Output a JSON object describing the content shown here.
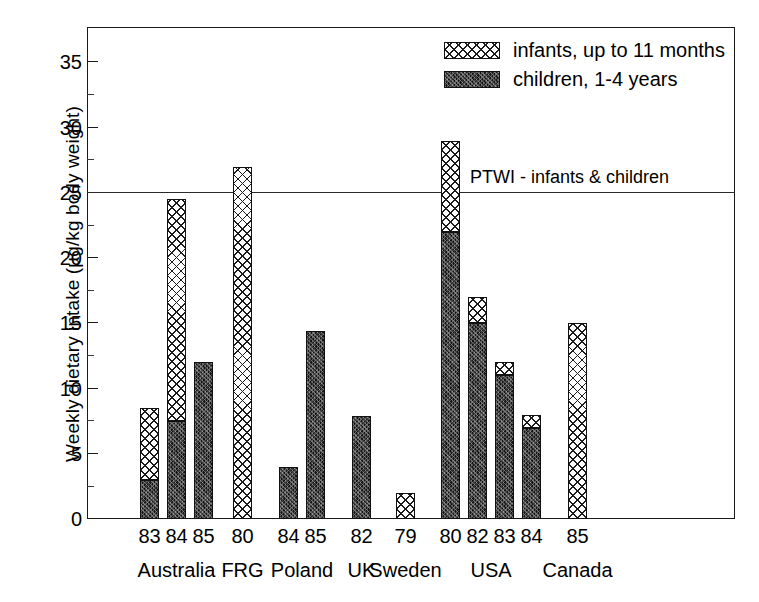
{
  "chart_data": {
    "type": "bar",
    "title": "",
    "subtitle": "",
    "xlabel": "",
    "ylabel": "Weekly dietary intake (µg/kg body weight)",
    "ylim": [
      0,
      37.5
    ],
    "yticks": [
      0,
      5,
      10,
      15,
      20,
      25,
      30,
      35
    ],
    "ytick_labels": [
      "0",
      "5",
      "10",
      "15",
      "20",
      "25",
      "30",
      "35"
    ],
    "yminor_ticks": [
      2.5,
      7.5,
      12.5,
      17.5,
      22.5,
      27.5,
      32.5
    ],
    "grid": false,
    "stacked": true,
    "legend_position": "top-right",
    "legend": [
      {
        "name": "infants, up to 11 months",
        "pattern": "cross-hatch"
      },
      {
        "name": "children, 1-4 years",
        "pattern": "dark-stipple"
      }
    ],
    "series": [
      {
        "name": "children, 1-4 years",
        "values": [
          3.0,
          7.5,
          12.0,
          0.0,
          4.0,
          14.4,
          7.9,
          0.0,
          22.0,
          15.0,
          11.0,
          7.0,
          0.0
        ]
      },
      {
        "name": "infants, up to 11 months",
        "values": [
          5.5,
          17.0,
          0.0,
          27.0,
          0.0,
          0.0,
          0.0,
          2.0,
          7.0,
          2.0,
          1.0,
          1.0,
          15.0
        ]
      }
    ],
    "totals": [
      8.5,
      24.5,
      12.0,
      27.0,
      4.0,
      14.4,
      7.9,
      2.0,
      29.0,
      17.0,
      12.0,
      8.0,
      15.0
    ],
    "categories": [
      "83",
      "84",
      "85",
      "80",
      "84",
      "85",
      "82",
      "79",
      "80",
      "82",
      "83",
      "84",
      "85"
    ],
    "groups": [
      {
        "label": "Australia",
        "years": [
          "83",
          "84",
          "85"
        ]
      },
      {
        "label": "FRG",
        "years": [
          "80"
        ]
      },
      {
        "label": "Poland",
        "years": [
          "84",
          "85"
        ]
      },
      {
        "label": "UK",
        "years": [
          "82"
        ]
      },
      {
        "label": "Sweden",
        "years": [
          "79"
        ]
      },
      {
        "label": "USA",
        "years": [
          "80",
          "82",
          "83",
          "84"
        ]
      },
      {
        "label": "Canada",
        "years": [
          "85"
        ]
      }
    ],
    "annotations": [
      {
        "text": "PTWI - infants & children",
        "y": 25,
        "type": "hline-label"
      }
    ],
    "reference_lines": [
      {
        "label": "PTWI - infants & children",
        "value": 25
      }
    ],
    "bars": [
      {
        "group": "Australia",
        "year": "83",
        "children": 3.0,
        "infants_top": 8.5,
        "x": 140
      },
      {
        "group": "Australia",
        "year": "84",
        "children": 7.5,
        "infants_top": 24.5,
        "x": 167
      },
      {
        "group": "Australia",
        "year": "85",
        "children": 12.0,
        "infants_top": 12.0,
        "x": 194
      },
      {
        "group": "FRG",
        "year": "80",
        "children": 0.0,
        "infants_top": 27.0,
        "x": 233
      },
      {
        "group": "Poland",
        "year": "84",
        "children": 4.0,
        "infants_top": 4.0,
        "x": 279
      },
      {
        "group": "Poland",
        "year": "85",
        "children": 14.4,
        "infants_top": 14.4,
        "x": 306
      },
      {
        "group": "UK",
        "year": "82",
        "children": 7.9,
        "infants_top": 7.9,
        "x": 352
      },
      {
        "group": "Sweden",
        "year": "79",
        "children": 0.0,
        "infants_top": 2.0,
        "x": 396
      },
      {
        "group": "USA",
        "year": "80",
        "children": 22.0,
        "infants_top": 29.0,
        "x": 441
      },
      {
        "group": "USA",
        "year": "82",
        "children": 15.0,
        "infants_top": 17.0,
        "x": 468
      },
      {
        "group": "USA",
        "year": "83",
        "children": 11.0,
        "infants_top": 12.0,
        "x": 495
      },
      {
        "group": "USA",
        "year": "84",
        "children": 7.0,
        "infants_top": 8.0,
        "x": 522
      },
      {
        "group": "Canada",
        "year": "85",
        "children": 0.0,
        "infants_top": 15.0,
        "x": 568
      }
    ]
  },
  "axis": {
    "ylabel": "Weekly dietary intake (µg/kg body weight)",
    "ytick_labels": [
      "35",
      "30",
      "25",
      "20",
      "15",
      "10",
      "5",
      "0"
    ]
  },
  "legend": {
    "items": [
      {
        "label": "infants, up to 11 months"
      },
      {
        "label": "children, 1-4 years"
      }
    ]
  },
  "annotation": {
    "ptwi": "PTWI - infants & children"
  },
  "xaxis": {
    "years": [
      "83",
      "84",
      "85",
      "80",
      "84",
      "85",
      "82",
      "79",
      "80",
      "82",
      "83",
      "84",
      "85"
    ],
    "groups": [
      "Australia",
      "FRG",
      "Poland",
      "UK",
      "Sweden",
      "USA",
      "Canada"
    ]
  }
}
